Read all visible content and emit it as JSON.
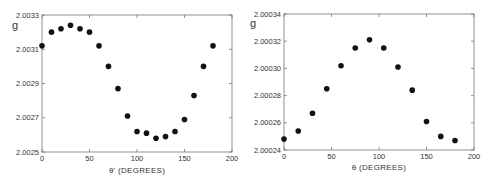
{
  "chart_data": [
    {
      "type": "scatter",
      "title": "",
      "xlabel": "θ' (DEGREES)",
      "ylabel": "g",
      "xlim": [
        0,
        200
      ],
      "ylim": [
        2.0025,
        2.0033
      ],
      "x_ticks": [
        "0",
        "50",
        "100",
        "150",
        "200"
      ],
      "y_ticks": [
        "2.0025",
        "2.0027",
        "2.0029",
        "2.0031",
        "2.0033"
      ],
      "grid": false,
      "legend": null,
      "series": [
        {
          "name": "g vs theta-prime",
          "x": [
            0,
            10,
            20,
            30,
            40,
            50,
            60,
            70,
            80,
            90,
            100,
            110,
            120,
            130,
            140,
            150,
            160,
            170,
            180
          ],
          "y": [
            2.00312,
            2.0032,
            2.00322,
            2.00324,
            2.00322,
            2.0032,
            2.00312,
            2.003,
            2.00287,
            2.00271,
            2.00262,
            2.00261,
            2.00258,
            2.00259,
            2.00262,
            2.00269,
            2.00283,
            2.003,
            2.00312
          ]
        }
      ]
    },
    {
      "type": "scatter",
      "title": "",
      "xlabel": "θ (DEGREES)",
      "ylabel": "g",
      "xlim": [
        0,
        200
      ],
      "ylim": [
        2.00024,
        2.00034
      ],
      "x_ticks": [
        "0",
        "50",
        "100",
        "150",
        "200"
      ],
      "y_ticks": [
        "2.00024",
        "2.00026",
        "2.00028",
        "2.00030",
        "2.00032",
        "2.00034"
      ],
      "grid": false,
      "legend": null,
      "series": [
        {
          "name": "g vs theta",
          "x": [
            0,
            15,
            30,
            45,
            60,
            75,
            90,
            105,
            120,
            135,
            150,
            165,
            180
          ],
          "y": [
            2.000248,
            2.000254,
            2.000267,
            2.000285,
            2.000302,
            2.000315,
            2.000321,
            2.000315,
            2.000301,
            2.000284,
            2.000261,
            2.00025,
            2.000247
          ]
        }
      ]
    }
  ],
  "labels": {
    "left_ylabel": "g",
    "left_xlabel": "θ' (DEGREES)",
    "right_ylabel": "g",
    "right_xlabel": "θ (DEGREES)"
  },
  "style": {
    "axis_color": "#777777",
    "marker_color": "#111111"
  }
}
